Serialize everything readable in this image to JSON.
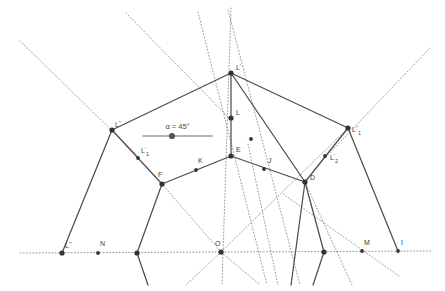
{
  "figure": {
    "background_color": "#ffffff",
    "solid_line_color": "#4d4d4d",
    "dotted_line_color": "#8f8f8f",
    "point_color": "#333333",
    "label_color": "#3c3c3c",
    "axis_color": "#909090"
  },
  "slider": {
    "name": "alpha-slider",
    "label": "α = 45°",
    "value": 45,
    "unit": "°",
    "track_color": "#9a9a9a",
    "handle_color": "#555555",
    "x1": 143,
    "x2": 212,
    "y": 136,
    "handle_x": 172
  },
  "points": [
    {
      "id": "Lprime",
      "label": "L",
      "sup": "'",
      "sub": "",
      "x": 231,
      "y": 73,
      "lx": 236,
      "ly": 70,
      "big": true
    },
    {
      "id": "L",
      "label": "L",
      "sup": "",
      "sub": "",
      "x": 231,
      "y": 118,
      "lx": 236,
      "ly": 115,
      "big": true
    },
    {
      "id": "E",
      "label": "E",
      "sup": "",
      "sub": "",
      "x": 231,
      "y": 156,
      "lx": 236,
      "ly": 152,
      "big": true
    },
    {
      "id": "Ldprime",
      "label": "L",
      "sup": "''",
      "sub": "",
      "x": 112,
      "y": 130,
      "lx": 115,
      "ly": 127,
      "big": true
    },
    {
      "id": "Ldprime1",
      "label": "L",
      "sup": "''",
      "sub": "1",
      "x": 348,
      "y": 128,
      "lx": 352,
      "ly": 132,
      "big": true
    },
    {
      "id": "Lprime1",
      "label": "L",
      "sup": "'",
      "sub": "1",
      "x": 138,
      "y": 158,
      "lx": 141,
      "ly": 153,
      "big": false
    },
    {
      "id": "Lprime2",
      "label": "L",
      "sup": "'",
      "sub": "2",
      "x": 325,
      "y": 156,
      "lx": 330,
      "ly": 160,
      "big": false
    },
    {
      "id": "F",
      "label": "F",
      "sup": "",
      "sub": "",
      "x": 162,
      "y": 184,
      "lx": 158,
      "ly": 177,
      "big": true
    },
    {
      "id": "K",
      "label": "K",
      "sup": "",
      "sub": "",
      "x": 196,
      "y": 170,
      "lx": 198,
      "ly": 163,
      "big": false
    },
    {
      "id": "J",
      "label": "J",
      "sup": "",
      "sub": "",
      "x": 264,
      "y": 169,
      "lx": 268,
      "ly": 163,
      "big": false
    },
    {
      "id": "D",
      "label": "D",
      "sup": "",
      "sub": "",
      "x": 305,
      "y": 182,
      "lx": 310,
      "ly": 180,
      "big": true
    },
    {
      "id": "mid-right",
      "label": "",
      "sup": "",
      "sub": "",
      "x": 251,
      "y": 139,
      "lx": 0,
      "ly": 0,
      "big": false
    },
    {
      "id": "Ltprime",
      "label": "L",
      "sup": "'''",
      "sub": "",
      "x": 62,
      "y": 253,
      "lx": 65,
      "ly": 248,
      "big": true
    },
    {
      "id": "N",
      "label": "N",
      "sup": "",
      "sub": "",
      "x": 98,
      "y": 253,
      "lx": 100,
      "ly": 246,
      "big": false
    },
    {
      "id": "axis-p1",
      "label": "",
      "sup": "",
      "sub": "",
      "x": 137,
      "y": 253,
      "lx": 0,
      "ly": 0,
      "big": true
    },
    {
      "id": "O",
      "label": "O",
      "sup": "",
      "sub": "",
      "x": 221,
      "y": 252,
      "lx": 215,
      "ly": 246,
      "big": true
    },
    {
      "id": "axis-p2",
      "label": "",
      "sup": "",
      "sub": "",
      "x": 324,
      "y": 252,
      "lx": 0,
      "ly": 0,
      "big": true
    },
    {
      "id": "M",
      "label": "M",
      "sup": "",
      "sub": "",
      "x": 362,
      "y": 251,
      "lx": 364,
      "ly": 245,
      "big": false
    },
    {
      "id": "I",
      "label": "I",
      "sup": "",
      "sub": "",
      "x": 398,
      "y": 251,
      "lx": 401,
      "ly": 245,
      "big": false
    }
  ],
  "solid_edges": [
    {
      "name": "edge-Ldprime-Lprime",
      "x1": 112,
      "y1": 130,
      "x2": 231,
      "y2": 73
    },
    {
      "name": "edge-Lprime-Ldprime1",
      "x1": 231,
      "y1": 73,
      "x2": 348,
      "y2": 128
    },
    {
      "name": "edge-Lprime-L-E",
      "x1": 231,
      "y1": 73,
      "x2": 231,
      "y2": 156
    },
    {
      "name": "edge-Ldprime-Lprime1-F",
      "x1": 112,
      "y1": 130,
      "x2": 162,
      "y2": 184
    },
    {
      "name": "edge-F-K-E",
      "x1": 162,
      "y1": 184,
      "x2": 231,
      "y2": 156
    },
    {
      "name": "edge-E-J-D",
      "x1": 231,
      "y1": 156,
      "x2": 305,
      "y2": 182
    },
    {
      "name": "edge-D-Lprime2-Ldprime1",
      "x1": 305,
      "y1": 182,
      "x2": 348,
      "y2": 128
    },
    {
      "name": "edge-Lprime-midright-D",
      "x1": 231,
      "y1": 73,
      "x2": 305,
      "y2": 182
    },
    {
      "name": "edge-Ldprime-Ltprime",
      "x1": 112,
      "y1": 130,
      "x2": 62,
      "y2": 253
    },
    {
      "name": "edge-F-axisp1",
      "x1": 162,
      "y1": 184,
      "x2": 137,
      "y2": 253
    },
    {
      "name": "edge-axisp1-low",
      "x1": 137,
      "y1": 253,
      "x2": 148,
      "y2": 285
    },
    {
      "name": "edge-D-axisp2",
      "x1": 305,
      "y1": 182,
      "x2": 324,
      "y2": 252
    },
    {
      "name": "edge-axisp2-low",
      "x1": 324,
      "y1": 252,
      "x2": 313,
      "y2": 285
    },
    {
      "name": "edge-Ldprime1-I",
      "x1": 348,
      "y1": 128,
      "x2": 398,
      "y2": 251
    },
    {
      "name": "edge-D-lowleft",
      "x1": 305,
      "y1": 182,
      "x2": 291,
      "y2": 285
    }
  ],
  "dotted_lines": [
    {
      "name": "dotted-axis-horizontal",
      "x1": 20,
      "y1": 253,
      "x2": 432,
      "y2": 251
    },
    {
      "name": "dotted-vertical-through-O",
      "x1": 231,
      "y1": 8,
      "x2": 222,
      "y2": 285
    },
    {
      "name": "dotted-topleft-to-Ldprime",
      "x1": 20,
      "y1": 41,
      "x2": 137,
      "y2": 155
    },
    {
      "name": "dotted-upper-mid-ray",
      "x1": 126,
      "y1": 13,
      "x2": 231,
      "y2": 120
    },
    {
      "name": "dotted-Lprime-steep",
      "x1": 198,
      "y1": 12,
      "x2": 267,
      "y2": 285
    },
    {
      "name": "dotted-Lprime-to-lower",
      "x1": 228,
      "y1": 10,
      "x2": 300,
      "y2": 285
    },
    {
      "name": "dotted-topright-to-Ldprime1",
      "x1": 430,
      "y1": 48,
      "x2": 321,
      "y2": 162
    },
    {
      "name": "dotted-O-to-upperright",
      "x1": 221,
      "y1": 252,
      "x2": 348,
      "y2": 128
    },
    {
      "name": "dotted-O-to-F-upleft",
      "x1": 221,
      "y1": 252,
      "x2": 162,
      "y2": 184
    },
    {
      "name": "dotted-O-downright",
      "x1": 221,
      "y1": 252,
      "x2": 260,
      "y2": 285
    },
    {
      "name": "dotted-O-downleft",
      "x1": 221,
      "y1": 252,
      "x2": 186,
      "y2": 285
    },
    {
      "name": "dotted-D-to-M-down",
      "x1": 305,
      "y1": 182,
      "x2": 352,
      "y2": 285
    },
    {
      "name": "dotted-right-diagonal",
      "x1": 283,
      "y1": 194,
      "x2": 399,
      "y2": 276
    },
    {
      "name": "dotted-left-steep-down",
      "x1": 248,
      "y1": 144,
      "x2": 278,
      "y2": 285
    }
  ]
}
